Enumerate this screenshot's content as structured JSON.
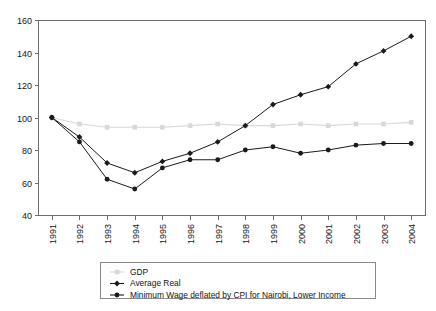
{
  "chart_data": {
    "type": "line",
    "title": "",
    "subtitle": "",
    "xlabel": "",
    "ylabel": "",
    "categories": [
      "1991",
      "1992",
      "1993",
      "1994",
      "1995",
      "1996",
      "1997",
      "1998",
      "1999",
      "2000",
      "2001",
      "2002",
      "2003",
      "2004"
    ],
    "x_tick_labels": [
      "1991",
      "1992",
      "1993",
      "1994",
      "1995",
      "1996",
      "1997",
      "1998",
      "1999",
      "2000",
      "2001",
      "2002",
      "2003",
      "2004"
    ],
    "y_tick_labels": [
      "40",
      "60",
      "80",
      "100",
      "120",
      "140",
      "160"
    ],
    "y_ticks": [
      40,
      60,
      80,
      100,
      120,
      140,
      160
    ],
    "ylim": [
      40,
      160
    ],
    "grid": false,
    "legend_position": "bottom-center",
    "series": [
      {
        "name": "GDP",
        "color": "#d8d8d8",
        "marker": "square",
        "values": [
          100,
          96,
          94,
          94,
          94,
          95,
          96,
          95,
          95,
          96,
          95,
          96,
          96,
          97
        ]
      },
      {
        "name": "Average Real",
        "color": "#1a1a1a",
        "marker": "diamond",
        "values": [
          100,
          88,
          72,
          66,
          73,
          78,
          85,
          95,
          108,
          114,
          119,
          133,
          141,
          150
        ]
      },
      {
        "name": "Minimum Wage deflated by CPI for Nairobi, Lower Income",
        "color": "#1a1a1a",
        "marker": "circle",
        "values": [
          100,
          85,
          62,
          56,
          69,
          74,
          74,
          80,
          82,
          78,
          80,
          83,
          84,
          84
        ]
      }
    ]
  },
  "legend": {
    "entries": [
      {
        "label": "GDP"
      },
      {
        "label": "Average Real"
      },
      {
        "label": "Minimum Wage deflated by CPI for Nairobi, Lower Income"
      }
    ]
  },
  "axes": {
    "plot_left": 38,
    "plot_right": 425,
    "plot_top": 20,
    "plot_bottom": 215
  }
}
